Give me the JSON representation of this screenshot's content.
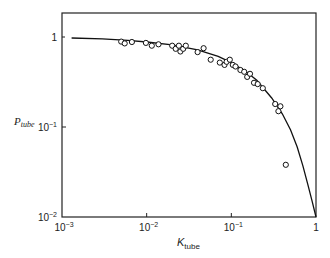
{
  "chart_data": {
    "type": "scatter",
    "title": "",
    "xlabel": "K",
    "xlabel_sub": "tube",
    "ylabel": "P",
    "ylabel_sub": "tube",
    "xscale": "log",
    "yscale": "log",
    "xlim": [
      0.001,
      1
    ],
    "ylim": [
      0.01,
      1.6
    ],
    "grid": false,
    "legend": null,
    "x_ticks": [
      {
        "value": 0.001,
        "label_base": "10",
        "label_exp": "−3"
      },
      {
        "value": 0.01,
        "label_base": "10",
        "label_exp": "−2"
      },
      {
        "value": 0.1,
        "label_base": "10",
        "label_exp": "−1"
      },
      {
        "value": 1,
        "label_base": "1",
        "label_exp": ""
      }
    ],
    "y_ticks": [
      {
        "value": 1,
        "label_base": "1",
        "label_exp": ""
      },
      {
        "value": 0.1,
        "label_base": "10",
        "label_exp": "−1"
      },
      {
        "value": 0.01,
        "label_base": "10",
        "label_exp": "−2"
      }
    ],
    "series": [
      {
        "name": "measured",
        "marker": "open-circle",
        "points": [
          {
            "x": 0.005,
            "y": 0.89
          },
          {
            "x": 0.0055,
            "y": 0.85
          },
          {
            "x": 0.0067,
            "y": 0.88
          },
          {
            "x": 0.0098,
            "y": 0.86
          },
          {
            "x": 0.0115,
            "y": 0.8
          },
          {
            "x": 0.0138,
            "y": 0.83
          },
          {
            "x": 0.02,
            "y": 0.8
          },
          {
            "x": 0.022,
            "y": 0.74
          },
          {
            "x": 0.024,
            "y": 0.8
          },
          {
            "x": 0.025,
            "y": 0.69
          },
          {
            "x": 0.027,
            "y": 0.74
          },
          {
            "x": 0.029,
            "y": 0.8
          },
          {
            "x": 0.04,
            "y": 0.68
          },
          {
            "x": 0.047,
            "y": 0.75
          },
          {
            "x": 0.057,
            "y": 0.56
          },
          {
            "x": 0.073,
            "y": 0.52
          },
          {
            "x": 0.083,
            "y": 0.49
          },
          {
            "x": 0.088,
            "y": 0.53
          },
          {
            "x": 0.096,
            "y": 0.56
          },
          {
            "x": 0.104,
            "y": 0.49
          },
          {
            "x": 0.112,
            "y": 0.47
          },
          {
            "x": 0.128,
            "y": 0.43
          },
          {
            "x": 0.142,
            "y": 0.41
          },
          {
            "x": 0.154,
            "y": 0.36
          },
          {
            "x": 0.166,
            "y": 0.39
          },
          {
            "x": 0.185,
            "y": 0.31
          },
          {
            "x": 0.205,
            "y": 0.3
          },
          {
            "x": 0.235,
            "y": 0.27
          },
          {
            "x": 0.33,
            "y": 0.18
          },
          {
            "x": 0.36,
            "y": 0.15
          },
          {
            "x": 0.38,
            "y": 0.17
          },
          {
            "x": 0.44,
            "y": 0.038
          }
        ]
      },
      {
        "name": "model",
        "marker": "line",
        "points": [
          {
            "x": 0.0013,
            "y": 0.975
          },
          {
            "x": 0.003,
            "y": 0.955
          },
          {
            "x": 0.006,
            "y": 0.92
          },
          {
            "x": 0.01,
            "y": 0.88
          },
          {
            "x": 0.02,
            "y": 0.82
          },
          {
            "x": 0.04,
            "y": 0.72
          },
          {
            "x": 0.07,
            "y": 0.61
          },
          {
            "x": 0.1,
            "y": 0.52
          },
          {
            "x": 0.15,
            "y": 0.41
          },
          {
            "x": 0.2,
            "y": 0.33
          },
          {
            "x": 0.3,
            "y": 0.21
          },
          {
            "x": 0.4,
            "y": 0.14
          },
          {
            "x": 0.5,
            "y": 0.093
          },
          {
            "x": 0.6,
            "y": 0.06
          },
          {
            "x": 0.7,
            "y": 0.037
          },
          {
            "x": 0.8,
            "y": 0.023
          },
          {
            "x": 0.9,
            "y": 0.015
          },
          {
            "x": 1.0,
            "y": 0.01
          }
        ]
      }
    ]
  }
}
